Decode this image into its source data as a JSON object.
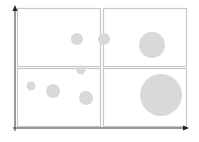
{
  "chart_data": {
    "type": "scatter",
    "subtype": "bubble-quadrant",
    "title": "",
    "xlabel": "",
    "ylabel": "",
    "grid": "2x2 quadrants",
    "legend": null,
    "quadrants": [
      {
        "id": "top-left",
        "x": 17,
        "y": 8,
        "w": 83,
        "h": 58
      },
      {
        "id": "top-right",
        "x": 103,
        "y": 8,
        "w": 83,
        "h": 58
      },
      {
        "id": "bottom-left",
        "x": 17,
        "y": 68,
        "w": 83,
        "h": 58
      },
      {
        "id": "bottom-right",
        "x": 103,
        "y": 68,
        "w": 83,
        "h": 58
      }
    ],
    "bubbles": [
      {
        "cx": 77,
        "cy": 39,
        "r": 6
      },
      {
        "cx": 104,
        "cy": 39,
        "r": 6
      },
      {
        "cx": 152,
        "cy": 45,
        "r": 13
      },
      {
        "cx": 81,
        "cy": 70,
        "r": 4.5
      },
      {
        "cx": 31,
        "cy": 86,
        "r": 4.5
      },
      {
        "cx": 53,
        "cy": 91,
        "r": 7
      },
      {
        "cx": 86,
        "cy": 98,
        "r": 7
      },
      {
        "cx": 161,
        "cy": 95,
        "r": 21
      }
    ]
  },
  "colors": {
    "axis": "#222222",
    "quadrant_border": "#c8c8c8",
    "bubble_fill": "#d9d9d9"
  }
}
